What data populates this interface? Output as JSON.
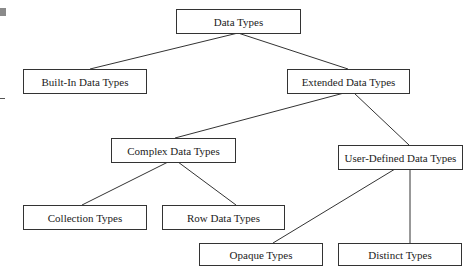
{
  "diagram": {
    "title": "Data Types",
    "nodes": {
      "root": "Data Types",
      "builtin": "Built-In Data Types",
      "extended": "Extended Data Types",
      "complex": "Complex Data Types",
      "user_defined": "User-Defined Data Types",
      "collection": "Collection Types",
      "row": "Row Data Types",
      "opaque": "Opaque Types",
      "distinct": "Distinct Types"
    },
    "edges": [
      [
        "root",
        "builtin"
      ],
      [
        "root",
        "extended"
      ],
      [
        "extended",
        "complex"
      ],
      [
        "extended",
        "user_defined"
      ],
      [
        "complex",
        "collection"
      ],
      [
        "complex",
        "row"
      ],
      [
        "user_defined",
        "opaque"
      ],
      [
        "user_defined",
        "distinct"
      ]
    ]
  }
}
